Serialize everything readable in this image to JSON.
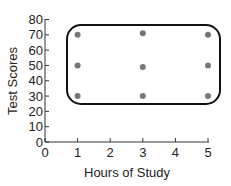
{
  "chart_data": {
    "type": "scatter",
    "title": "",
    "xlabel": "Hours of Study",
    "ylabel": "Test Scores",
    "xlim": [
      0,
      5
    ],
    "ylim": [
      0,
      80
    ],
    "x_ticks": [
      "0",
      "1",
      "2",
      "3",
      "4",
      "5"
    ],
    "y_ticks": [
      "0",
      "10",
      "20",
      "30",
      "40",
      "50",
      "60",
      "70",
      "80"
    ],
    "grid": false,
    "legend": null,
    "series": [
      {
        "name": "students",
        "points": [
          {
            "x": 1,
            "y": 70
          },
          {
            "x": 3,
            "y": 71
          },
          {
            "x": 5,
            "y": 70
          },
          {
            "x": 1,
            "y": 50
          },
          {
            "x": 3,
            "y": 49
          },
          {
            "x": 5,
            "y": 50
          },
          {
            "x": 1,
            "y": 30
          },
          {
            "x": 3,
            "y": 30
          },
          {
            "x": 5,
            "y": 30
          }
        ],
        "color": "#777777"
      }
    ],
    "annotations": [
      {
        "type": "rounded-rectangle",
        "x_range": [
          0.7,
          5.4
        ],
        "y_range": [
          24,
          76
        ],
        "description": "enclosing outline around all points",
        "color": "#111111"
      }
    ]
  }
}
